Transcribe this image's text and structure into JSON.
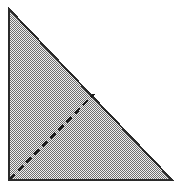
{
  "figure": {
    "name": "shaded-right-triangle-with-dashed-line",
    "canvas": {
      "width": 180,
      "height": 190,
      "background_color": "#ffffff"
    },
    "shapes": {
      "triangle": {
        "label": "right-triangle",
        "vertices": [
          {
            "name": "apex-top-left",
            "x": 9,
            "y": 9
          },
          {
            "name": "vertex-bottom-left",
            "x": 9,
            "y": 180
          },
          {
            "name": "vertex-bottom-right",
            "x": 172,
            "y": 180
          }
        ],
        "points_attr": "9,9 9,180 172,180",
        "right_angle_at": "vertex-bottom-left",
        "stroke_color": "#2b2b2b",
        "stroke_width": 2,
        "fill_pattern": "checkerboard-stipple",
        "fill_tone_percent": 50,
        "fill_light_color": "#f0f0f0",
        "fill_dark_color": "#6e6e6e"
      },
      "dashed_line": {
        "label": "dashed-cevian",
        "start": {
          "name": "vertex-bottom-left",
          "x": 10,
          "y": 179
        },
        "end": {
          "name": "point-on-hypotenuse",
          "x": 94,
          "y": 94
        },
        "stroke_color": "#1c1c1c",
        "stroke_width": 2.6,
        "dash_length": 7,
        "gap_length": 4.5,
        "dash_array": "7 4.5",
        "approx_angle_degrees": 45
      }
    }
  }
}
